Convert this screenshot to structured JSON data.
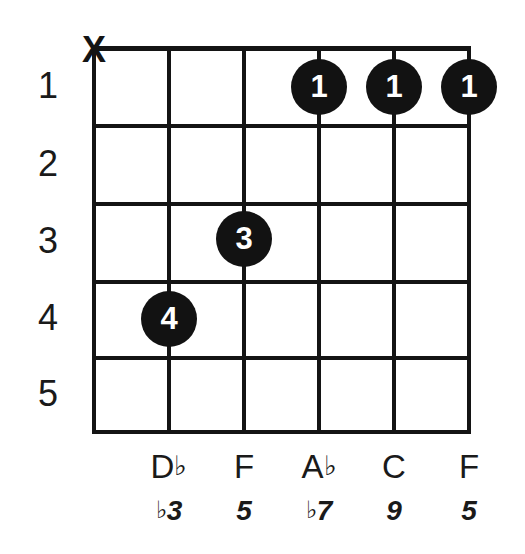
{
  "diagram": {
    "type": "guitar-chord-diagram",
    "string_count": 6,
    "fret_count": 5,
    "ink_color": "#121212",
    "background_color": "#ffffff"
  },
  "fret_numbers": [
    {
      "label": "1"
    },
    {
      "label": "2"
    },
    {
      "label": "3"
    },
    {
      "label": "4"
    },
    {
      "label": "5"
    }
  ],
  "string_markers": [
    {
      "symbol": "X",
      "meaning": "muted",
      "string": 1
    }
  ],
  "finger_dots": [
    {
      "finger": "1",
      "string": 4,
      "fret": 1
    },
    {
      "finger": "1",
      "string": 5,
      "fret": 1
    },
    {
      "finger": "1",
      "string": 6,
      "fret": 1
    },
    {
      "finger": "3",
      "string": 3,
      "fret": 3
    },
    {
      "finger": "4",
      "string": 2,
      "fret": 4
    }
  ],
  "note_names": [
    {
      "string": 2,
      "letter": "D",
      "accidental": "♭"
    },
    {
      "string": 3,
      "letter": "F",
      "accidental": ""
    },
    {
      "string": 4,
      "letter": "A",
      "accidental": "♭"
    },
    {
      "string": 5,
      "letter": "C",
      "accidental": ""
    },
    {
      "string": 6,
      "letter": "F",
      "accidental": ""
    }
  ],
  "intervals": [
    {
      "string": 2,
      "accidental": "♭",
      "degree": "3"
    },
    {
      "string": 3,
      "accidental": "",
      "degree": "5"
    },
    {
      "string": 4,
      "accidental": "♭",
      "degree": "7"
    },
    {
      "string": 5,
      "accidental": "",
      "degree": "9"
    },
    {
      "string": 6,
      "accidental": "",
      "degree": "5"
    }
  ]
}
